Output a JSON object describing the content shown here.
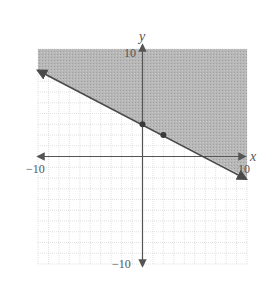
{
  "chart_data": {
    "type": "line",
    "title": "",
    "subtitle": "",
    "xlabel": "x",
    "ylabel": "y",
    "xlim": [
      -10,
      10
    ],
    "ylim": [
      -10,
      10
    ],
    "grid": true,
    "grid_step": 1,
    "x_tick_labels": [
      "-10",
      "10"
    ],
    "y_tick_labels": [
      "10",
      "-10"
    ],
    "inequality": "y >= -1/2 x + 3",
    "boundary_line": {
      "slope": -0.5,
      "intercept": 3,
      "style": "solid",
      "from": [
        -10,
        8
      ],
      "to": [
        10,
        -2
      ]
    },
    "shaded_region": "above",
    "points": [
      {
        "x": 0,
        "y": 3
      },
      {
        "x": 2,
        "y": 2
      }
    ],
    "legend": null
  },
  "labels": {
    "x_axis": "x",
    "y_axis": "y",
    "x_min": "−10",
    "x_max": "10",
    "y_max": "10",
    "y_min": "−10"
  },
  "colors": {
    "shade": "#a9a9a9",
    "line": "#4a4a4a",
    "grid": "#c8c8c8",
    "axis": "#555555"
  }
}
